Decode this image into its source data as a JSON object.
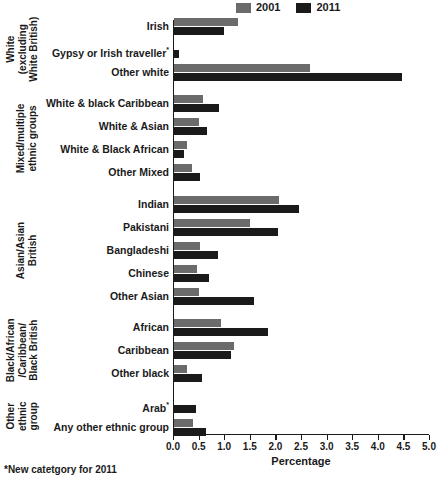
{
  "legend": {
    "entries": [
      {
        "label": "2001",
        "color": "#6b6b6b"
      },
      {
        "label": "2011",
        "color": "#1a1a1a"
      }
    ]
  },
  "axis": {
    "xlabel": "Percentage",
    "ticks": [
      "0.0",
      "0.5",
      "1.0",
      "1.5",
      "2.0",
      "2.5",
      "3.0",
      "3.5",
      "4.0",
      "4.5",
      "5.0"
    ]
  },
  "footnote": "*New catetgory for 2011",
  "groups": [
    {
      "label": "White\n(excluding\nWhite British)"
    },
    {
      "label": "Mixed/multiple\nethnic groups"
    },
    {
      "label": "Asian/Asian\nBritish"
    },
    {
      "label": "Black/African\n/Caribbean/\nBlack British"
    },
    {
      "label": "Other\nethnic\ngroup"
    }
  ],
  "chart_data": {
    "type": "bar",
    "title": "",
    "xlabel": "Percentage",
    "ylabel": "",
    "xlim": [
      0.0,
      5.0
    ],
    "grid": false,
    "legend_position": "top-right",
    "orientation": "horizontal",
    "categories": [
      "Irish",
      "Gypsy or Irish traveller*",
      "Other white",
      "White & black Caribbean",
      "White & Asian",
      "White & Black African",
      "Other Mixed",
      "Indian",
      "Pakistani",
      "Bangladeshi",
      "Chinese",
      "Other Asian",
      "African",
      "Caribbean",
      "Other black",
      "Arab*",
      "Any other ethnic group"
    ],
    "category_groups": [
      "White (excluding White British)",
      "White (excluding White British)",
      "White (excluding White British)",
      "Mixed/multiple ethnic groups",
      "Mixed/multiple ethnic groups",
      "Mixed/multiple ethnic groups",
      "Mixed/multiple ethnic groups",
      "Asian/Asian British",
      "Asian/Asian British",
      "Asian/Asian British",
      "Asian/Asian British",
      "Asian/Asian British",
      "Black/African/Caribbean/Black British",
      "Black/African/Caribbean/Black British",
      "Black/African/Caribbean/Black British",
      "Other ethnic group",
      "Other ethnic group"
    ],
    "series": [
      {
        "name": "2001",
        "color": "#6b6b6b",
        "values": [
          1.25,
          null,
          2.65,
          0.57,
          0.49,
          0.25,
          0.35,
          2.06,
          1.49,
          0.51,
          0.45,
          0.49,
          0.92,
          1.18,
          0.25,
          null,
          0.37
        ]
      },
      {
        "name": "2011",
        "color": "#1a1a1a",
        "values": [
          0.98,
          0.1,
          4.45,
          0.88,
          0.65,
          0.2,
          0.51,
          2.45,
          2.04,
          0.86,
          0.68,
          1.57,
          1.84,
          1.12,
          0.55,
          0.42,
          0.62
        ]
      }
    ]
  }
}
